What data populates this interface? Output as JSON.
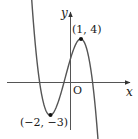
{
  "chart_data": {
    "type": "line",
    "title": "",
    "xlabel": "x",
    "ylabel": "y",
    "origin_label": "O",
    "grid": false,
    "legend": null,
    "series": [
      {
        "name": "f(x)",
        "points_of_interest": [
          {
            "label": "(1, 4)",
            "x": 1,
            "y": 4,
            "kind": "local maximum"
          },
          {
            "label": "(−2, −3)",
            "x": -2,
            "y": -3,
            "kind": "local minimum"
          }
        ],
        "x_range": [
          -5,
          4.4
        ]
      }
    ],
    "annotations": [
      {
        "text": "(1, 4)",
        "x": 1,
        "y": 4
      },
      {
        "text": "(−2, −3)",
        "x": -2,
        "y": -3
      }
    ],
    "xlim": [
      -6.3,
      6
    ],
    "ylim": [
      -4.3,
      6.5
    ]
  },
  "labels": {
    "y_axis": "y",
    "x_axis": "x",
    "origin": "O",
    "max_point": "(1, 4)",
    "min_point": "(−2, −3)"
  },
  "colors": {
    "curve": "#555555",
    "axis": "#444444",
    "point": "#111111"
  }
}
